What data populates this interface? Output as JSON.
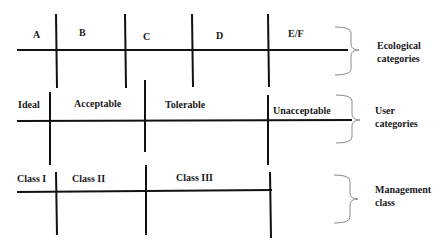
{
  "diagram": {
    "rows": [
      {
        "name": "ecological",
        "category_label_line1": "Ecological",
        "category_label_line2": "categories",
        "segments": [
          "A",
          "B",
          "C",
          "D",
          "E/F"
        ]
      },
      {
        "name": "user",
        "category_label_line1": "User",
        "category_label_line2": "categories",
        "segments": [
          "Ideal",
          "Acceptable",
          "Tolerable",
          "Unacceptable"
        ]
      },
      {
        "name": "management",
        "category_label_line1": "Management",
        "category_label_line2": "class",
        "segments": [
          "Class I",
          "Class II",
          "Class III"
        ]
      }
    ],
    "colors": {
      "line": "#111111",
      "brace": "#8a8a8a",
      "text": "#1a1a1a",
      "background": "#ffffff"
    }
  }
}
